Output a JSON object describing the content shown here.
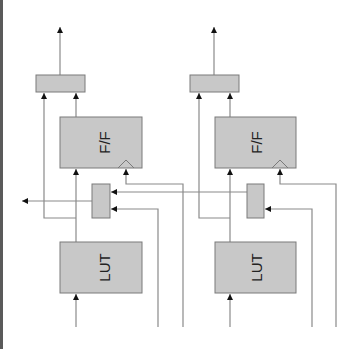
{
  "diagram": {
    "colors": {
      "block_fill": "#c8c8c8",
      "block_stroke": "#7a7a7a",
      "wire": "#8a8a8a",
      "arrow": "#111111",
      "text": "#222222",
      "border": "#5a5a5a"
    },
    "cells": [
      {
        "name": "cell-1",
        "output_mux_label": "",
        "flipflop_label": "F/F",
        "select_mux_label": "",
        "lut_label": "LUT"
      },
      {
        "name": "cell-2",
        "output_mux_label": "",
        "flipflop_label": "F/F",
        "select_mux_label": "",
        "lut_label": "LUT"
      }
    ]
  }
}
